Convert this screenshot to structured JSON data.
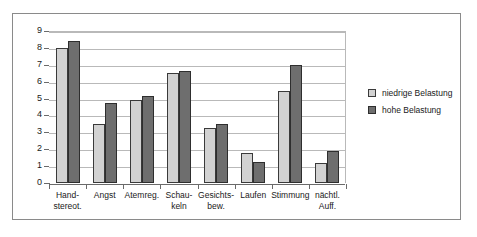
{
  "chart_data": {
    "type": "bar",
    "title": "",
    "xlabel": "",
    "ylabel": "",
    "ylim": [
      0,
      9
    ],
    "ytick_values": [
      9,
      8,
      7,
      6,
      5,
      4,
      3,
      2,
      1,
      0
    ],
    "ytick_labels": [
      "9",
      "8",
      "7",
      "6",
      "5",
      "4",
      "3",
      "2",
      "1",
      "0"
    ],
    "grid": true,
    "legend_position": "right",
    "categories": [
      "Hand-\nstereot.",
      "Angst",
      "Atemreg.",
      "Schau-\nkeln",
      "Gesichts-\nbew.",
      "Laufen",
      "Stimmung",
      "nächtl.\nAuff."
    ],
    "category_labels": [
      [
        "Hand-",
        "stereot."
      ],
      [
        "Angst",
        ""
      ],
      [
        "Atemreg.",
        ""
      ],
      [
        "Schau-",
        "keln"
      ],
      [
        "Gesichts-",
        "bew."
      ],
      [
        "Laufen",
        ""
      ],
      [
        "Stimmung",
        ""
      ],
      [
        "nächtl.",
        "Auff."
      ]
    ],
    "series": [
      {
        "name": "niedrige Belastung",
        "color": "#d2d2d2",
        "values": [
          8.0,
          3.5,
          4.9,
          6.5,
          3.25,
          1.75,
          5.45,
          1.2
        ]
      },
      {
        "name": "hohe Belastung",
        "color": "#6e6e6e",
        "values": [
          8.4,
          4.75,
          5.15,
          6.65,
          3.5,
          1.25,
          7.0,
          1.9
        ]
      }
    ]
  },
  "legend": {
    "entries": [
      {
        "label": "niedrige Belastung",
        "swatch": "low"
      },
      {
        "label": "hohe Belastung",
        "swatch": "high"
      }
    ]
  }
}
